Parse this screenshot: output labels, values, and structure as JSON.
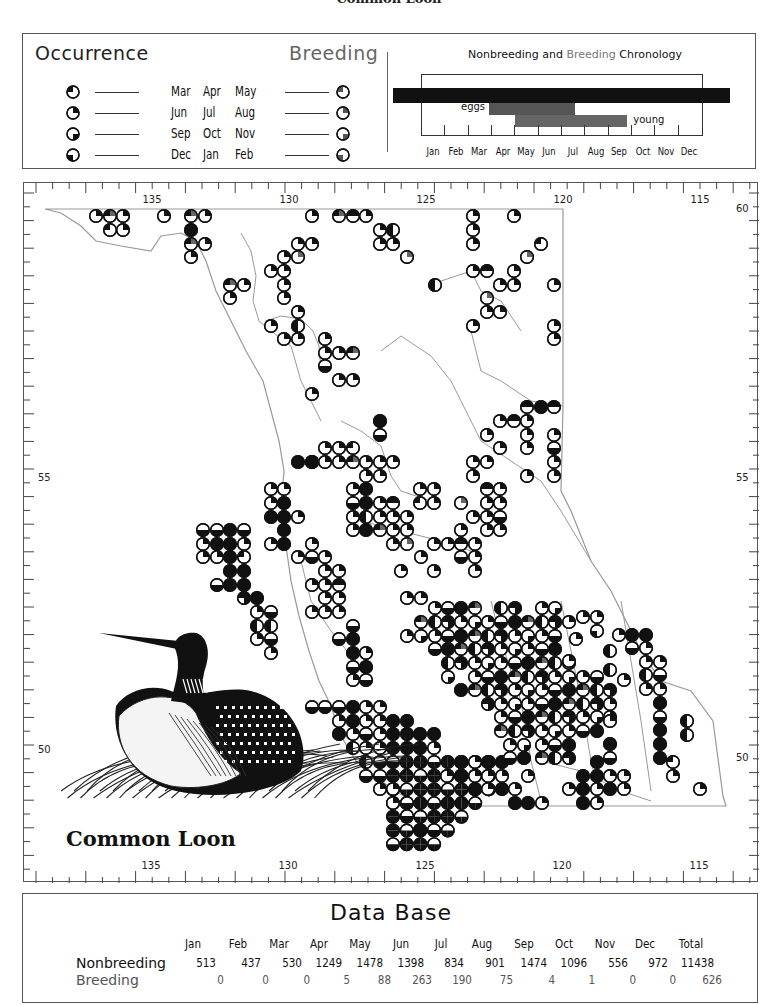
{
  "page_title": "Common Loon",
  "legend": {
    "occurrence_title": "Occurrence",
    "breeding_title": "Breeding",
    "rows": [
      {
        "months": [
          "Mar",
          "Apr",
          "May"
        ],
        "quarter": "top-left"
      },
      {
        "months": [
          "Jun",
          "Jul",
          "Aug"
        ],
        "quarter": "top-right"
      },
      {
        "months": [
          "Sep",
          "Oct",
          "Nov"
        ],
        "quarter": "bottom-right"
      },
      {
        "months": [
          "Dec",
          "Jan",
          "Feb"
        ],
        "quarter": "bottom-left"
      }
    ]
  },
  "chronology": {
    "title_part1": "Nonbreeding",
    "title_part2": "and",
    "title_part3": "Breeding",
    "title_part4": "Chronology",
    "months": [
      "Jan",
      "Feb",
      "Mar",
      "Apr",
      "May",
      "Jun",
      "Jul",
      "Aug",
      "Sep",
      "Oct",
      "Nov",
      "Dec"
    ],
    "bars": [
      {
        "name": "nonbreeding",
        "start": 0.0,
        "end": 12.0,
        "color": "#111111",
        "label": ""
      },
      {
        "name": "eggs",
        "start": 3.0,
        "end": 6.7,
        "color": "#555555",
        "label": "eggs"
      },
      {
        "name": "young",
        "start": 4.0,
        "end": 8.8,
        "color": "#666666",
        "label": "young"
      }
    ]
  },
  "map": {
    "lon_labels_top": [
      "135",
      "130",
      "125",
      "120",
      "115"
    ],
    "lon_labels_bottom": [
      "135",
      "130",
      "125",
      "120",
      "115"
    ],
    "lat_labels_left": [
      "55",
      "50"
    ],
    "lat_labels_right": [
      "60",
      "55",
      "50"
    ],
    "species_label": "Common Loon",
    "colors": {
      "dot_dark": "#111111",
      "dot_gray": "#666666",
      "coast": "#999999"
    }
  },
  "chart_data": {
    "type": "table",
    "title": "Data Base",
    "columns": [
      "Jan",
      "Feb",
      "Mar",
      "Apr",
      "May",
      "Jun",
      "Jul",
      "Aug",
      "Sep",
      "Oct",
      "Nov",
      "Dec",
      "Total"
    ],
    "series": [
      {
        "name": "Nonbreeding",
        "values": [
          513,
          437,
          530,
          1249,
          1478,
          1398,
          834,
          901,
          1474,
          1096,
          556,
          972,
          11438
        ]
      },
      {
        "name": "Breeding",
        "values": [
          0,
          0,
          0,
          5,
          88,
          263,
          190,
          75,
          4,
          1,
          0,
          0,
          626
        ]
      }
    ]
  },
  "database": {
    "title": "Data Base",
    "columns": [
      "Jan",
      "Feb",
      "Mar",
      "Apr",
      "May",
      "Jun",
      "Jul",
      "Aug",
      "Sep",
      "Oct",
      "Nov",
      "Dec",
      "Total"
    ],
    "rows": [
      {
        "label": "Nonbreeding",
        "values": [
          "513",
          "437",
          "530",
          "1249",
          "1478",
          "1398",
          "834",
          "901",
          "1474",
          "1096",
          "556",
          "972",
          "11438"
        ]
      },
      {
        "label": "Breeding",
        "values": [
          "0",
          "0",
          "0",
          "5",
          "88",
          "263",
          "190",
          "75",
          "4",
          "1",
          "0",
          "0",
          "626"
        ]
      }
    ]
  }
}
